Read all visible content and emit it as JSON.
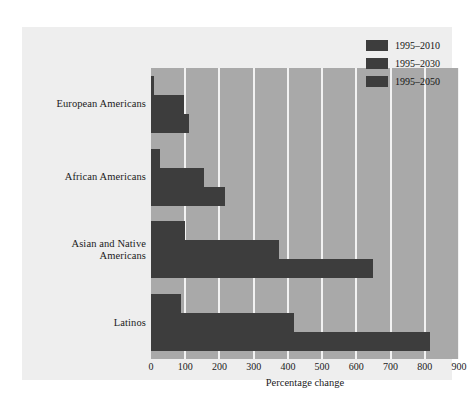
{
  "chart_data": {
    "type": "bar",
    "orientation": "horizontal",
    "title": "",
    "xlabel": "Percentage change",
    "ylabel": "",
    "xlim": [
      0,
      900
    ],
    "xticks": [
      0,
      100,
      200,
      300,
      400,
      500,
      600,
      700,
      800,
      900
    ],
    "xtick_labels": [
      "0",
      "100",
      "200",
      "300",
      "400",
      "500",
      "600",
      "700",
      "800",
      "900"
    ],
    "grid": true,
    "grid_axis": "x",
    "legend_position": "upper right",
    "categories": [
      "European Americans",
      "African Americans",
      "Asian and Native Americans",
      "Latinos"
    ],
    "category_lines": [
      [
        "European Americans"
      ],
      [
        "African Americans"
      ],
      [
        "Asian and Native",
        "Americans"
      ],
      [
        "Latinos"
      ]
    ],
    "series": [
      {
        "name": "1995–2010",
        "color": "#3d3d3d",
        "values": [
          10,
          25,
          100,
          88
        ]
      },
      {
        "name": "1995–2030",
        "color": "#3d3d3d",
        "values": [
          95,
          155,
          375,
          418
        ]
      },
      {
        "name": "1995–2050",
        "color": "#3d3d3d",
        "values": [
          112,
          215,
          650,
          815
        ]
      }
    ]
  },
  "legend": {
    "items": [
      {
        "label": "1995–2010",
        "color": "#3d3d3d"
      },
      {
        "label": "1995–2030",
        "color": "#3d3d3d"
      },
      {
        "label": "1995–2050",
        "color": "#3d3d3d"
      }
    ]
  },
  "colors": {
    "figure_background": "#ffffff",
    "panel_background": "#eeeeee",
    "plot_background": "#a9a9a9",
    "gridline": "#f2f2f2",
    "bar": "#3d3d3d",
    "text": "#1b1b1b"
  }
}
